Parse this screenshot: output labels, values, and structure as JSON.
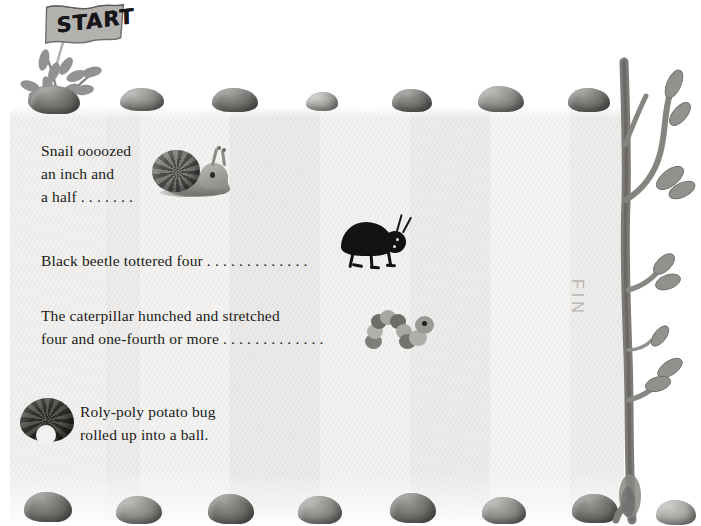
{
  "page": {
    "background_color": "#ffffff",
    "paper_color": "#f2f1ef",
    "text_color": "#1b1a18"
  },
  "flag": {
    "label": "START",
    "icon": "flag-icon",
    "cloth_color": "#a9a7a4"
  },
  "verses": [
    {
      "id": "snail",
      "lines": "Snail oooozed\nan inch and\na half . . . . . . ."
    },
    {
      "id": "beetle",
      "lines": "Black beetle tottered four . . . . . . . . . . . . ."
    },
    {
      "id": "caterpillar",
      "lines": "The caterpillar hunched and stretched\nfour and one-fourth or more . . . . . . . . . . . . ."
    },
    {
      "id": "rolypoly",
      "lines": "Roly-poly potato bug\nrolled up into a ball."
    }
  ],
  "fin": {
    "label": "FIN",
    "color": "#b9b7b4"
  },
  "creatures": [
    {
      "name": "snail",
      "icon": "snail-icon"
    },
    {
      "name": "black-beetle",
      "icon": "beetle-icon"
    },
    {
      "name": "caterpillar",
      "icon": "caterpillar-icon"
    },
    {
      "name": "roly-poly-potato-bug",
      "icon": "pillbug-icon"
    }
  ],
  "scenery": {
    "tree": {
      "name": "tree-branch",
      "color": "#8a8885"
    },
    "plant": {
      "name": "fern-plant",
      "color": "#8d8b88"
    },
    "rock_color": "#8e8c89",
    "top_rocks": 8,
    "bottom_rocks": 8
  }
}
